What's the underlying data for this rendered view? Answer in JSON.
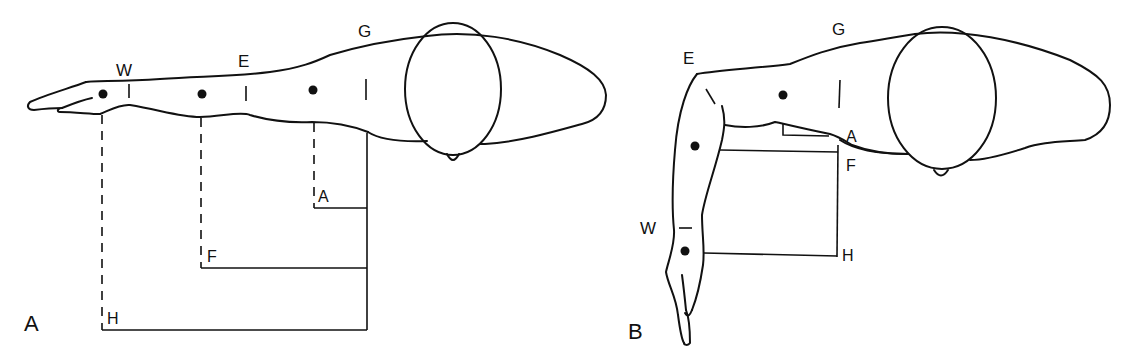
{
  "figure": {
    "panels": [
      {
        "id": "A",
        "panel_label": "A",
        "description": "Arm extended horizontally",
        "joint_labels": {
          "wrist": "W",
          "elbow": "E",
          "glenohumeral": "G"
        },
        "measure_labels": {
          "arm": "A",
          "forearm": "F",
          "hand": "H"
        }
      },
      {
        "id": "B",
        "panel_label": "B",
        "description": "Arm abducted with elbow flexed, forearm hanging down",
        "joint_labels": {
          "wrist": "W",
          "elbow": "E",
          "glenohumeral": "G"
        },
        "measure_labels": {
          "arm": "A",
          "forearm": "F",
          "hand": "H"
        }
      }
    ],
    "colors": {
      "ink": "#111111",
      "background": "#ffffff"
    }
  }
}
